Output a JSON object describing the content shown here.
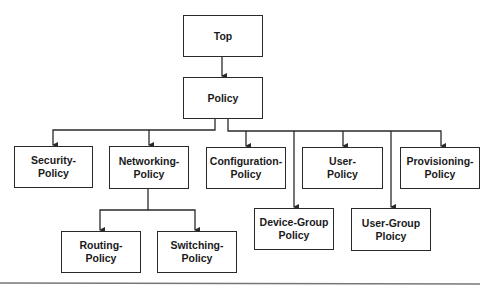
{
  "diagram": {
    "type": "hierarchy-tree",
    "colors": {
      "line": "#2a2a2a",
      "box_fill": "#ffffff",
      "text": "#1a1a1a",
      "rule": "#777777"
    },
    "nodes": {
      "top": {
        "line1": "Top",
        "line2": ""
      },
      "policy": {
        "line1": "Policy",
        "line2": ""
      },
      "security": {
        "line1": "Security-",
        "line2": "Policy"
      },
      "networking": {
        "line1": "Networking-",
        "line2": "Policy"
      },
      "configuration": {
        "line1": "Configuration-",
        "line2": "Policy"
      },
      "user": {
        "line1": "User-",
        "line2": "Policy"
      },
      "provisioning": {
        "line1": "Provisioning-",
        "line2": "Policy"
      },
      "routing": {
        "line1": "Routing-",
        "line2": "Policy"
      },
      "switching": {
        "line1": "Switching-",
        "line2": "Policy"
      },
      "device_group": {
        "line1": "Device-Group",
        "line2": "Policy"
      },
      "user_group": {
        "line1": "User-Group",
        "line2": "Ploicy"
      }
    },
    "edges": [
      [
        "Top",
        "Policy"
      ],
      [
        "Policy",
        "Security-Policy"
      ],
      [
        "Policy",
        "Networking-Policy"
      ],
      [
        "Policy",
        "Configuration-Policy"
      ],
      [
        "Policy",
        "User-Policy"
      ],
      [
        "Policy",
        "Provisioning-Policy"
      ],
      [
        "Policy",
        "Device-Group Policy"
      ],
      [
        "Policy",
        "User-Group Ploicy"
      ],
      [
        "Networking-Policy",
        "Routing-Policy"
      ],
      [
        "Networking-Policy",
        "Switching-Policy"
      ]
    ]
  }
}
